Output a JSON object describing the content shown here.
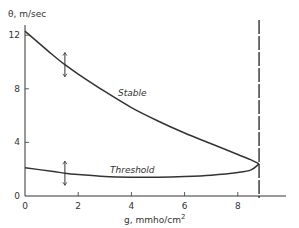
{
  "chart_data": {
    "type": "line",
    "title": "",
    "xlabel": "g, mmho/cm²",
    "xlabel_parts": {
      "base": "g, mmho/cm",
      "sup": "2"
    },
    "ylabel": "θ, m/sec",
    "xlim": [
      0,
      10
    ],
    "ylim": [
      0,
      13
    ],
    "grid": false,
    "legend": "none (curves labeled inline)",
    "x_ticks": [
      0,
      2,
      4,
      6,
      8
    ],
    "y_ticks": [
      0,
      4,
      8,
      12
    ],
    "series": [
      {
        "name": "Stable",
        "x": [
          0,
          1,
          1.5,
          2,
          3,
          4,
          5,
          6,
          7,
          8,
          8.5,
          8.8
        ],
        "y": [
          12.3,
          10.6,
          9.8,
          9.1,
          7.8,
          6.6,
          5.6,
          4.7,
          3.9,
          3.1,
          2.7,
          2.4
        ]
      },
      {
        "name": "Threshold",
        "x": [
          0,
          1,
          1.5,
          2,
          3,
          4,
          5,
          6,
          7,
          8,
          8.5,
          8.8
        ],
        "y": [
          2.1,
          1.85,
          1.7,
          1.6,
          1.45,
          1.4,
          1.4,
          1.45,
          1.55,
          1.75,
          1.95,
          2.4
        ]
      }
    ],
    "error_bars": [
      {
        "series": "Stable",
        "x": 1.5,
        "y": 9.8,
        "low": 8.9,
        "high": 10.7
      },
      {
        "series": "Threshold",
        "x": 1.5,
        "y": 1.7,
        "low": 0.8,
        "high": 2.6
      }
    ],
    "annotations": [
      {
        "type": "vertical-dashed-line",
        "x": 8.8,
        "description": "limit of stable/threshold curves"
      },
      {
        "type": "label",
        "text": "Stable",
        "near": "Stable curve"
      },
      {
        "type": "label",
        "text": "Threshold",
        "near": "Threshold curve"
      }
    ]
  }
}
